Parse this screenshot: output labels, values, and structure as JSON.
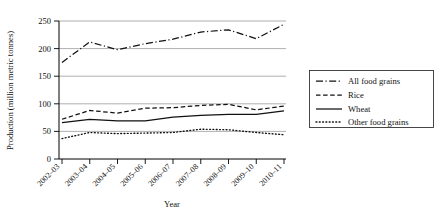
{
  "chart_data": {
    "type": "line",
    "title": "",
    "xlabel": "Year",
    "ylabel": "Production (million metric tonnes)",
    "categories": [
      "2002–03",
      "2003–04",
      "2004–05",
      "2005–06",
      "2006–07",
      "2007–08",
      "2008–09",
      "2009–10",
      "2010–11"
    ],
    "ylim": [
      0,
      250
    ],
    "yticks": [
      0,
      50,
      100,
      150,
      200,
      250
    ],
    "grid": true,
    "legend_position": "right",
    "series": [
      {
        "name": "All food grains",
        "style": "dash-dot",
        "values": [
          175,
          212,
          198,
          209,
          217,
          230,
          234,
          218,
          244
        ]
      },
      {
        "name": "Rice",
        "style": "dashed",
        "values": [
          72,
          88,
          83,
          92,
          93,
          97,
          99,
          89,
          96
        ]
      },
      {
        "name": "Wheat",
        "style": "solid",
        "values": [
          66,
          72,
          69,
          69,
          76,
          79,
          81,
          81,
          87
        ]
      },
      {
        "name": "Other food grains",
        "style": "dotted",
        "values": [
          37,
          48,
          46,
          47,
          48,
          54,
          53,
          48,
          44
        ]
      }
    ]
  },
  "axis": {
    "y_title": "Production (million metric tonnes)",
    "x_title": "Year",
    "y_ticks": [
      "0",
      "50",
      "100",
      "150",
      "200",
      "250"
    ],
    "x_ticks": [
      "2002–03",
      "2003–04",
      "2004–05",
      "2005–06",
      "2006–07",
      "2007–08",
      "2008–09",
      "2009–10",
      "2010–11"
    ]
  },
  "legend": {
    "items": [
      {
        "label": "All food grains"
      },
      {
        "label": "Rice"
      },
      {
        "label": "Wheat"
      },
      {
        "label": "Other food grains"
      }
    ]
  },
  "colors": {
    "line": "#111111",
    "grid": "#9a9a9a",
    "background": "#ffffff"
  }
}
